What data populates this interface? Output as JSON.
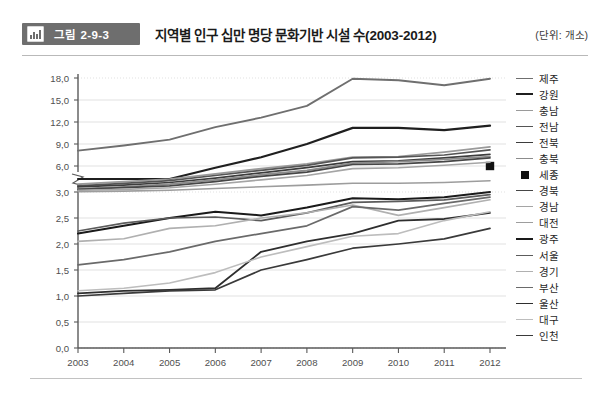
{
  "header": {
    "badge_label": "그림 2-9-3",
    "badge_icon": "bar-chart-icon",
    "title": "지역별 인구 십만 명당 문화기반 시설 수(2003-2012)",
    "unit": "(단위: 개소)"
  },
  "chart_data": {
    "type": "line",
    "title": "지역별 인구 십만 명당 문화기반 시설 수(2003-2012)",
    "xlabel": "",
    "ylabel": "",
    "unit": "개소",
    "grid": true,
    "legend_position": "right",
    "broken_axis": true,
    "axis_break_between": [
      3.0,
      6.0
    ],
    "ylim_lower": [
      0.0,
      3.0
    ],
    "ylim_upper": [
      3.0,
      18.0
    ],
    "yticks_lower": [
      "0,0",
      "0,5",
      "1,0",
      "1,5",
      "2,0",
      "2,5",
      "3,0"
    ],
    "yticks_upper": [
      "3,0",
      "6,0",
      "9,0",
      "12,0",
      "15,0",
      "18,0"
    ],
    "categories": [
      "2003",
      "2004",
      "2005",
      "2006",
      "2007",
      "2008",
      "2009",
      "2010",
      "2011",
      "2012"
    ],
    "x": [
      2003,
      2004,
      2005,
      2006,
      2007,
      2008,
      2009,
      2010,
      2011,
      2012
    ],
    "series": [
      {
        "name": "제주",
        "color": "#6f6f6f",
        "width": 1.9,
        "marker": "none",
        "values": [
          8.1,
          8.8,
          9.6,
          11.3,
          12.6,
          14.2,
          17.9,
          17.7,
          17.0,
          17.9
        ]
      },
      {
        "name": "강원",
        "color": "#1f1f1f",
        "width": 2.2,
        "marker": "none",
        "values": [
          4.5,
          4.5,
          4.5,
          5.8,
          7.2,
          9.0,
          11.2,
          11.2,
          10.9,
          11.5
        ]
      },
      {
        "name": "충남",
        "color": "#9a9a9a",
        "width": 1.7,
        "marker": "none",
        "values": [
          3.9,
          4.2,
          4.5,
          5.1,
          5.7,
          6.3,
          7.2,
          7.3,
          7.9,
          8.6
        ]
      },
      {
        "name": "전남",
        "color": "#555555",
        "width": 1.7,
        "marker": "none",
        "values": [
          3.7,
          4.0,
          4.3,
          4.9,
          5.5,
          6.1,
          7.1,
          7.2,
          7.5,
          8.2
        ]
      },
      {
        "name": "전북",
        "color": "#3d3d3d",
        "width": 1.7,
        "marker": "none",
        "values": [
          3.6,
          3.8,
          4.1,
          4.6,
          5.2,
          5.8,
          6.6,
          6.7,
          7.1,
          7.6
        ]
      },
      {
        "name": "충북",
        "color": "#8c8c8c",
        "width": 1.7,
        "marker": "none",
        "values": [
          3.4,
          3.6,
          3.9,
          4.4,
          5.0,
          5.5,
          6.4,
          6.6,
          6.9,
          7.3
        ]
      },
      {
        "name": "세종",
        "color": "#111111",
        "width": 0,
        "marker": "square",
        "values": [
          null,
          null,
          null,
          null,
          null,
          null,
          null,
          null,
          null,
          6.0
        ]
      },
      {
        "name": "경북",
        "color": "#464646",
        "width": 1.7,
        "marker": "none",
        "values": [
          3.3,
          3.5,
          3.7,
          4.2,
          4.8,
          5.3,
          6.2,
          6.3,
          6.6,
          7.1
        ]
      },
      {
        "name": "경남",
        "color": "#a5a5a5",
        "width": 1.6,
        "marker": "none",
        "values": [
          3.2,
          3.3,
          3.5,
          3.9,
          4.4,
          4.9,
          5.7,
          5.8,
          6.1,
          6.5
        ]
      },
      {
        "name": "대전",
        "color": "#9d9d9d",
        "width": 1.6,
        "marker": "none",
        "values": [
          3.05,
          3.1,
          3.2,
          3.4,
          3.6,
          3.8,
          4.0,
          4.0,
          4.1,
          4.3
        ]
      },
      {
        "name": "광주",
        "color": "#1a1a1a",
        "width": 2.0,
        "marker": "none",
        "values": [
          2.2,
          2.35,
          2.5,
          2.62,
          2.55,
          2.7,
          2.88,
          2.86,
          2.9,
          3.0
        ]
      },
      {
        "name": "서울",
        "color": "#5c5c5c",
        "width": 1.7,
        "marker": "none",
        "values": [
          2.25,
          2.4,
          2.5,
          2.52,
          2.45,
          2.6,
          2.8,
          2.82,
          2.85,
          2.95
        ]
      },
      {
        "name": "경기",
        "color": "#b0b0b0",
        "width": 1.6,
        "marker": "none",
        "values": [
          2.05,
          2.1,
          2.3,
          2.35,
          2.5,
          2.6,
          2.75,
          2.55,
          2.7,
          2.85
        ]
      },
      {
        "name": "부산",
        "color": "#6a6a6a",
        "width": 1.7,
        "marker": "none",
        "values": [
          1.6,
          1.7,
          1.85,
          2.05,
          2.2,
          2.35,
          2.72,
          2.65,
          2.78,
          2.9
        ]
      },
      {
        "name": "울산",
        "color": "#2e2e2e",
        "width": 1.8,
        "marker": "none",
        "values": [
          1.05,
          1.1,
          1.12,
          1.15,
          1.85,
          2.05,
          2.2,
          2.45,
          2.48,
          2.6
        ]
      },
      {
        "name": "대구",
        "color": "#bdbdbd",
        "width": 1.6,
        "marker": "none",
        "values": [
          1.1,
          1.15,
          1.25,
          1.45,
          1.75,
          1.95,
          2.15,
          2.2,
          2.45,
          2.62
        ]
      },
      {
        "name": "인천",
        "color": "#3a3a3a",
        "width": 1.7,
        "marker": "none",
        "values": [
          1.0,
          1.05,
          1.1,
          1.12,
          1.5,
          1.7,
          1.92,
          2.0,
          2.1,
          2.3
        ]
      }
    ]
  },
  "axis": {
    "tick_color": "#6b6b6b",
    "grid_color": "#d9d9d9",
    "axis_color": "#5a5a5a"
  }
}
